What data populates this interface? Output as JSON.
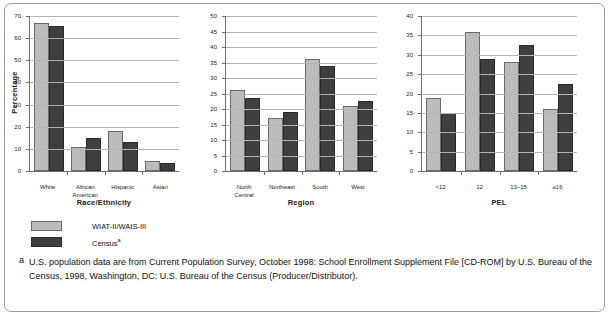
{
  "figure": {
    "footnote_marker": "a",
    "footnote_text": "U.S. population data are from Current Population Survey, October 1998: School Enrollment Supplement File [CD-ROM] by U.S. Bureau of the Census, 1998, Washington, DC: U.S. Bureau of the Census (Producer/Distributor)."
  },
  "legend": {
    "items": [
      {
        "label": "WIAT-II/WAIS-III",
        "color": "#bcbcbc",
        "marker": ""
      },
      {
        "label": "Census",
        "color": "#3f3f3f",
        "marker": "a"
      }
    ]
  },
  "chart_data": [
    {
      "type": "bar",
      "title": "",
      "xlabel": "Race/Ethnicity",
      "ylabel": "Percentage",
      "categories": [
        "White",
        "African\nAmerican",
        "Hispanic",
        "Asian"
      ],
      "ylim": [
        0,
        70
      ],
      "yticks": [
        0,
        10,
        20,
        30,
        40,
        50,
        60,
        70
      ],
      "grid": true,
      "legend_position": "below",
      "series": [
        {
          "name": "WIAT-II/WAIS-III",
          "color": "#bcbcbc",
          "values": [
            67.0,
            11.0,
            18.0,
            4.4
          ]
        },
        {
          "name": "Census",
          "color": "#3f3f3f",
          "values": [
            65.5,
            15.1,
            13.3,
            3.5
          ]
        }
      ]
    },
    {
      "type": "bar",
      "title": "",
      "xlabel": "Region",
      "ylabel": "",
      "categories": [
        "North\nCentral",
        "Northeast",
        "South",
        "West"
      ],
      "ylim": [
        0,
        50
      ],
      "yticks": [
        0,
        5,
        10,
        15,
        20,
        25,
        30,
        35,
        40,
        45,
        50
      ],
      "grid": true,
      "legend_position": "below",
      "series": [
        {
          "name": "WIAT-II/WAIS-III",
          "color": "#bcbcbc",
          "values": [
            26.0,
            17.2,
            36.0,
            21.0
          ]
        },
        {
          "name": "Census",
          "color": "#3f3f3f",
          "values": [
            23.7,
            19.0,
            34.0,
            22.7
          ]
        }
      ]
    },
    {
      "type": "bar",
      "title": "",
      "xlabel": "PEL",
      "ylabel": "",
      "categories": [
        "<12",
        "12",
        "13–15",
        "≥16"
      ],
      "ylim": [
        0,
        40
      ],
      "yticks": [
        0,
        5,
        10,
        15,
        20,
        25,
        30,
        35,
        40
      ],
      "grid": true,
      "legend_position": "below",
      "series": [
        {
          "name": "WIAT-II/WAIS-III",
          "color": "#bcbcbc",
          "values": [
            18.8,
            35.8,
            28.2,
            16.0
          ]
        },
        {
          "name": "Census",
          "color": "#3f3f3f",
          "values": [
            15.0,
            28.8,
            32.5,
            22.4
          ]
        }
      ]
    }
  ]
}
